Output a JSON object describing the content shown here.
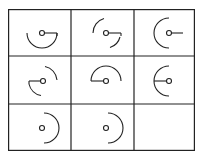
{
  "puzzle": {
    "rows": 3,
    "cols": 3,
    "line_color": "#222222",
    "background": "#ffffff",
    "cells": [
      {
        "row": 0,
        "col": 0,
        "arc": "bottom-half",
        "stick": "right",
        "desc": "arc bottom semicircle, stick to right"
      },
      {
        "row": 0,
        "col": 1,
        "arc": "top-left-and-bottom-right",
        "stick": "right",
        "desc": "two arcs, stick to right"
      },
      {
        "row": 0,
        "col": 2,
        "arc": "left-half",
        "stick": "right",
        "desc": "arc left semicircle, stick to right"
      },
      {
        "row": 1,
        "col": 0,
        "arc": "top-right-and-bottom-left",
        "stick": "left",
        "desc": "two arcs, stick to left"
      },
      {
        "row": 1,
        "col": 1,
        "arc": "top-half",
        "stick": "left",
        "desc": "arc top semicircle, stick to left"
      },
      {
        "row": 1,
        "col": 2,
        "arc": "left-half",
        "stick": "left",
        "desc": "arc left semicircle, stick to left"
      },
      {
        "row": 2,
        "col": 0,
        "arc": "right-half",
        "stick": "none",
        "desc": "arc right semicircle, no stick"
      },
      {
        "row": 2,
        "col": 1,
        "arc": "right-half",
        "stick": "none",
        "desc": "arc right semicircle, no stick"
      },
      {
        "row": 2,
        "col": 2,
        "arc": "empty",
        "stick": "none",
        "desc": "blank answer cell"
      }
    ]
  }
}
